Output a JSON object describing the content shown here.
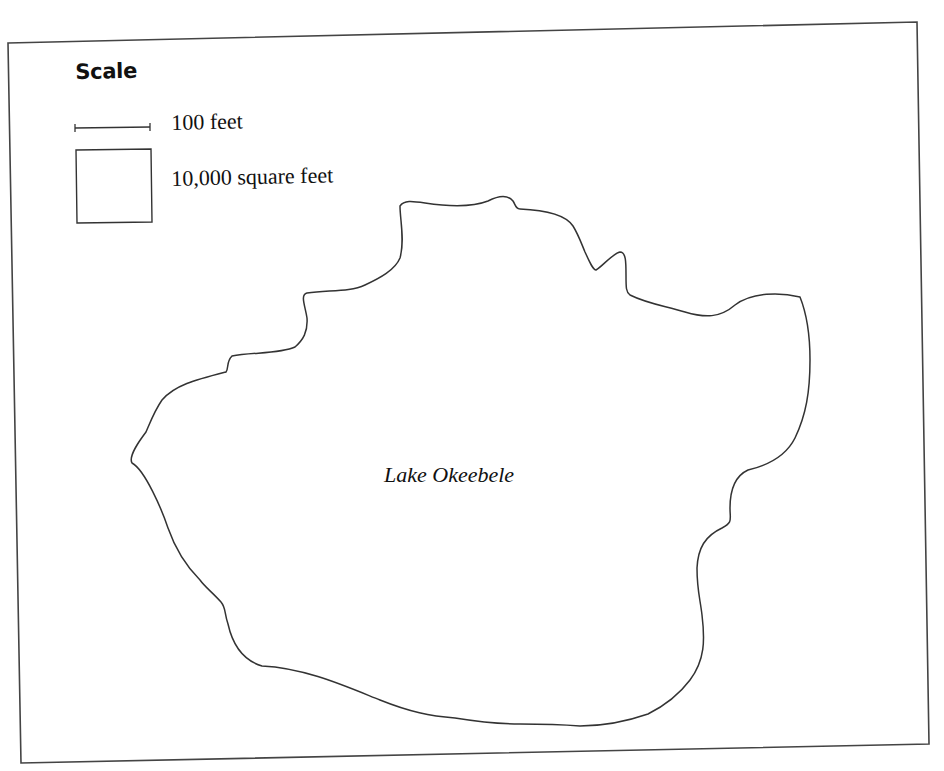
{
  "map": {
    "type": "outline map",
    "feature_label": "Lake Okeebele",
    "outline_color": "#333333",
    "border_color": "#444444",
    "background_color": "#ffffff"
  },
  "legend": {
    "title": "Scale",
    "items": [
      {
        "symbol": "scale-bar-icon",
        "label": "100 feet"
      },
      {
        "symbol": "square-area-icon",
        "label": "10,000 square feet"
      }
    ]
  }
}
